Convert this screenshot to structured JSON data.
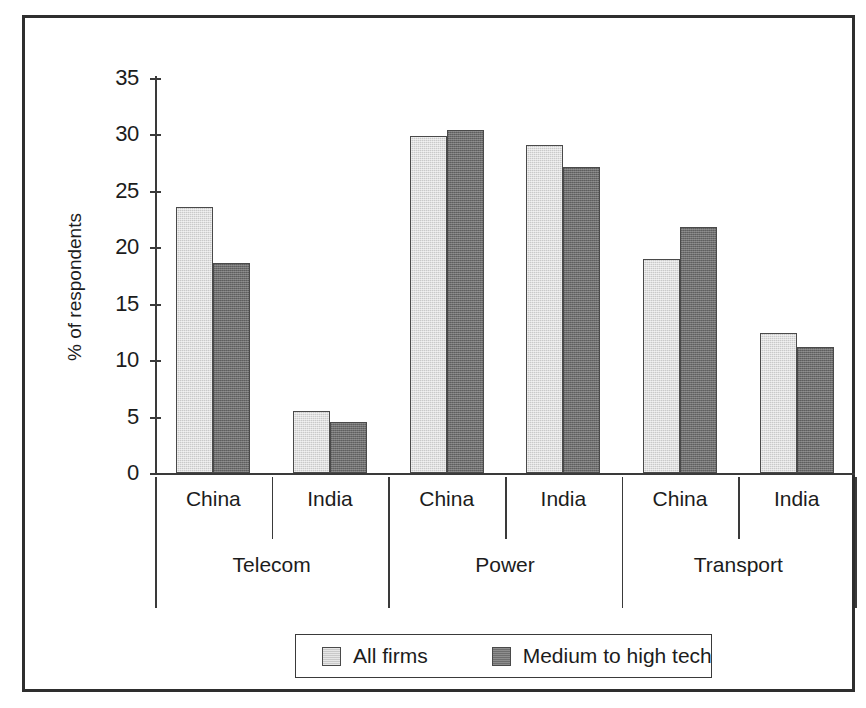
{
  "chart_data": {
    "type": "bar",
    "title": "",
    "xlabel": "",
    "ylabel": "% of respondents",
    "ylim": [
      0,
      35
    ],
    "ytick_labels": [
      "35",
      "30",
      "25",
      "20",
      "15",
      "10",
      "5",
      "0"
    ],
    "ytick_values": [
      35,
      30,
      25,
      20,
      15,
      10,
      5,
      0
    ],
    "grid": false,
    "legend_position": "bottom",
    "groups": [
      "Telecom",
      "Power",
      "Transport"
    ],
    "categories": [
      "China",
      "India",
      "China",
      "India",
      "China",
      "India"
    ],
    "series": [
      {
        "name": "All firms",
        "color": "#c9c9c9",
        "values": [
          23.6,
          5.5,
          29.9,
          29.1,
          19.0,
          12.4
        ]
      },
      {
        "name": "Medium to high tech",
        "color": "#6e6e6e",
        "values": [
          18.6,
          4.5,
          30.4,
          27.1,
          21.8,
          11.2
        ]
      }
    ],
    "group_structure": [
      {
        "group": "Telecom",
        "countries": [
          "China",
          "India"
        ]
      },
      {
        "group": "Power",
        "countries": [
          "China",
          "India"
        ]
      },
      {
        "group": "Transport",
        "countries": [
          "China",
          "India"
        ]
      }
    ]
  },
  "legend": {
    "items": [
      {
        "label": "All firms",
        "swatch": "light-gray-swatch"
      },
      {
        "label": "Medium to high tech",
        "swatch": "dark-gray-swatch"
      }
    ]
  },
  "colors": {
    "light_bar": "#c9c9c9",
    "dark_bar": "#6e6e6e",
    "axis": "#3a3a3a",
    "frame": "#2e2e2e",
    "text": "#1c1c1c",
    "background": "#ffffff"
  }
}
